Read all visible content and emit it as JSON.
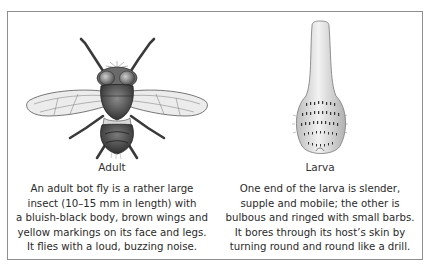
{
  "figure": {
    "panels": [
      {
        "id": "adult",
        "label": "Adult",
        "illustration": "bot-fly-adult-icon",
        "description_lines": [
          "An adult bot fly is a rather large",
          "insect (10–15 mm in length) with",
          "a bluish-black body, brown wings and",
          "yellow markings on its face and legs.",
          "It flies with a loud, buzzing noise."
        ]
      },
      {
        "id": "larva",
        "label": "Larva",
        "illustration": "bot-fly-larva-icon",
        "description_lines": [
          "One end of the larva is slender,",
          "supple and mobile; the other is",
          "bulbous and ringed with small barbs.",
          "It bores through its host’s skin by",
          "turning round and round like a drill."
        ]
      }
    ],
    "colors": {
      "frame_border": "#8f8f8f",
      "text": "#2a2a2a",
      "body_dark": "#3a3a3a",
      "wing": "#e6e6e6"
    }
  }
}
